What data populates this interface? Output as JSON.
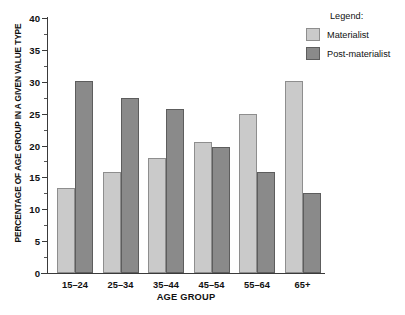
{
  "chart_data": {
    "type": "bar",
    "title": "",
    "xlabel": "AGE GROUP",
    "ylabel": "PERCENTAGE OF AGE GROUP IN A GIVEN VALUE TYPE",
    "categories": [
      "15–24",
      "25–34",
      "35–44",
      "45–54",
      "55–64",
      "65+"
    ],
    "series": [
      {
        "name": "Materialist",
        "color": "#cacaca",
        "values": [
          13.3,
          15.9,
          18.0,
          20.5,
          25.0,
          30.1
        ]
      },
      {
        "name": "Post-materialist",
        "color": "#8a8a8a",
        "values": [
          30.1,
          27.5,
          25.8,
          19.8,
          15.9,
          12.6
        ]
      }
    ],
    "ylim": [
      0,
      40
    ],
    "ytick_labels": [
      "0",
      "5",
      "10",
      "15",
      "20",
      "25",
      "30",
      "35",
      "40"
    ],
    "ytick_values": [
      0,
      5,
      10,
      15,
      20,
      25,
      30,
      35,
      40
    ],
    "yminor_values": [
      2.5,
      7.5,
      12.5,
      17.5,
      22.5,
      27.5,
      32.5,
      37.5
    ],
    "grid": false,
    "legend_position": "top-right"
  },
  "legend": {
    "title": "Legend:",
    "entries": [
      {
        "label": "Materialist",
        "swatch": "materialist-swatch"
      },
      {
        "label": "Post-materialist",
        "swatch": "post-materialist-swatch"
      }
    ]
  }
}
